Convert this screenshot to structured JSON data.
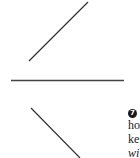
{
  "figure": {
    "lines": [
      {
        "name": "upper-diagonal",
        "x1": 29,
        "y1": 61,
        "x2": 88,
        "y2": 2,
        "color": "#333333"
      },
      {
        "name": "horizontal-divider",
        "x1": 11,
        "y1": 80,
        "x2": 124,
        "y2": 80,
        "color": "#444444"
      },
      {
        "name": "lower-diagonal",
        "x1": 31,
        "y1": 108,
        "x2": 80,
        "y2": 158,
        "color": "#333333"
      }
    ]
  },
  "annotation": {
    "marker": "7",
    "lines": [
      "ho",
      "ke",
      "wi"
    ]
  }
}
